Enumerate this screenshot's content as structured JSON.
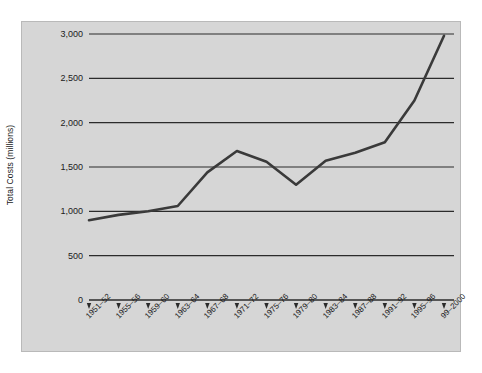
{
  "figure": {
    "background_color": "#ffffff",
    "plot_background_color": "#d6d6d6",
    "border_color": "#b9b9b9",
    "line_color": "#3a3a3a",
    "gridline_color": "#2b2b2b",
    "axis_color": "#2b2b2b"
  },
  "chart_data": {
    "type": "line",
    "title": "",
    "xlabel": "",
    "ylabel": "Total Costs (millions)",
    "categories": [
      "1951–52",
      "1955–56",
      "1959–60",
      "1963–64",
      "1967–68",
      "1971–72",
      "1975–76",
      "1979–80",
      "1983–84",
      "1987–88",
      "1991–92",
      "1995–96",
      "99–2000"
    ],
    "values": [
      900,
      960,
      1000,
      1060,
      1440,
      1680,
      1560,
      1300,
      1570,
      1660,
      1780,
      2250,
      2980
    ],
    "series": [
      {
        "name": "Total Costs",
        "values": [
          900,
          960,
          1000,
          1060,
          1440,
          1680,
          1560,
          1300,
          1570,
          1660,
          1780,
          2250,
          2980
        ]
      }
    ],
    "ylim": [
      0,
      3000
    ],
    "yticks": [
      0,
      500,
      1000,
      1500,
      2000,
      2500,
      3000
    ],
    "ytick_labels": [
      "0",
      "500",
      "1,000",
      "1,500",
      "2,000",
      "2,500",
      "3,000"
    ],
    "grid": true,
    "grid_axis": "y",
    "legend": false,
    "legend_position": "none",
    "xtick_rotation": -45
  }
}
